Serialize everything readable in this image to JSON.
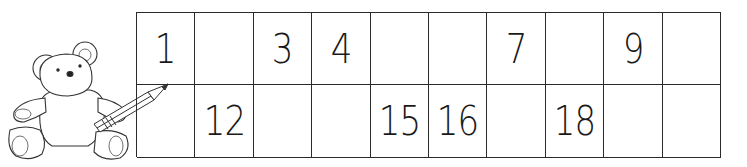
{
  "worksheet": {
    "title": "Number chart 1-20 fill in missing numbers",
    "rows": [
      [
        "1",
        "",
        "3",
        "4",
        "",
        "",
        "7",
        "",
        "9",
        ""
      ],
      [
        "",
        "12",
        "",
        "",
        "15",
        "16",
        "",
        "18",
        "",
        ""
      ]
    ]
  },
  "illustration": {
    "subject": "teddy bear holding pencil"
  }
}
